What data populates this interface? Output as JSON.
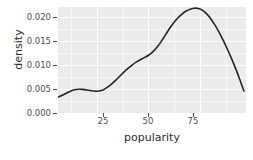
{
  "chart_data": {
    "type": "line",
    "title": "",
    "subtitle": "",
    "xlabel": "popularity",
    "ylabel": "density",
    "xlim": [
      6,
      97
    ],
    "ylim": [
      0.0,
      0.0222
    ],
    "x_ticks": [
      25,
      50,
      75
    ],
    "x_tick_labels": [
      "25",
      "50",
      "75"
    ],
    "y_ticks": [
      0.0,
      0.005,
      0.01,
      0.015,
      0.02
    ],
    "y_tick_labels": [
      "0.000",
      "0.005",
      "0.010",
      "0.015",
      "0.020"
    ],
    "grid": true,
    "grid_color": "#ffffff",
    "panel_background": "#ebebeb",
    "legend": "none",
    "line_color": "#262626",
    "line_width": 1.6,
    "series": [
      {
        "name": "density",
        "x": [
          6,
          8,
          10,
          12,
          14,
          16,
          18,
          20,
          22,
          24,
          26,
          28,
          30,
          32,
          34,
          36,
          38,
          40,
          42,
          44,
          46,
          48,
          50,
          52,
          54,
          56,
          58,
          60,
          62,
          64,
          66,
          68,
          70,
          72,
          74,
          76,
          78,
          80,
          82,
          84,
          86,
          88,
          90,
          92,
          94,
          96
        ],
        "y": [
          0.0033,
          0.0037,
          0.00415,
          0.00455,
          0.00485,
          0.00497,
          0.00495,
          0.00483,
          0.00468,
          0.00458,
          0.0046,
          0.00487,
          0.0054,
          0.0061,
          0.0069,
          0.00775,
          0.0086,
          0.0094,
          0.0101,
          0.0107,
          0.0112,
          0.01165,
          0.01215,
          0.01285,
          0.0138,
          0.015,
          0.01635,
          0.0177,
          0.0189,
          0.0199,
          0.0207,
          0.02135,
          0.02175,
          0.02195,
          0.0219,
          0.0215,
          0.02075,
          0.0197,
          0.0184,
          0.0169,
          0.0152,
          0.01335,
          0.0114,
          0.0093,
          0.007,
          0.0046
        ]
      }
    ]
  },
  "axes": {
    "y_title": "density",
    "x_title": "popularity"
  }
}
